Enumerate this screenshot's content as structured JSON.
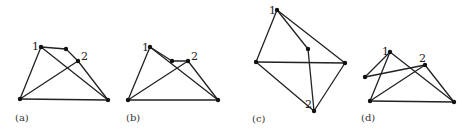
{
  "figure": {
    "panels": [
      {
        "id": "a",
        "caption": "(a)",
        "caption_pos": [
          15,
          121
        ],
        "nodes": [
          {
            "id": "1",
            "x": 41,
            "y": 47,
            "label": "1",
            "lx": 32,
            "ly": 50
          },
          {
            "id": "m",
            "x": 66,
            "y": 49,
            "label": ""
          },
          {
            "id": "2",
            "x": 78,
            "y": 61,
            "label": "2",
            "lx": 81,
            "ly": 60
          },
          {
            "id": "bl",
            "x": 20,
            "y": 99,
            "label": ""
          },
          {
            "id": "br",
            "x": 108,
            "y": 100,
            "label": ""
          }
        ],
        "edges": [
          [
            "1",
            "m"
          ],
          [
            "m",
            "2"
          ],
          [
            "2",
            "br"
          ],
          [
            "1",
            "bl"
          ],
          [
            "1",
            "br"
          ],
          [
            "bl",
            "2"
          ],
          [
            "bl",
            "br"
          ]
        ]
      },
      {
        "id": "b",
        "caption": "(b)",
        "caption_pos": [
          126,
          121
        ],
        "nodes": [
          {
            "id": "1",
            "x": 150,
            "y": 47,
            "label": "1",
            "lx": 142,
            "ly": 51
          },
          {
            "id": "m",
            "x": 172,
            "y": 61,
            "label": ""
          },
          {
            "id": "2",
            "x": 188,
            "y": 61,
            "label": "2",
            "lx": 191,
            "ly": 60
          },
          {
            "id": "bl",
            "x": 128,
            "y": 100,
            "label": ""
          },
          {
            "id": "br",
            "x": 218,
            "y": 100,
            "label": ""
          }
        ],
        "edges": [
          [
            "1",
            "m"
          ],
          [
            "m",
            "2"
          ],
          [
            "2",
            "br"
          ],
          [
            "1",
            "bl"
          ],
          [
            "1",
            "br"
          ],
          [
            "bl",
            "2"
          ],
          [
            "bl",
            "br"
          ]
        ]
      },
      {
        "id": "c",
        "caption": "(c)",
        "caption_pos": [
          252,
          122
        ],
        "nodes": [
          {
            "id": "1",
            "x": 277,
            "y": 10,
            "label": "1",
            "lx": 269,
            "ly": 14
          },
          {
            "id": "m",
            "x": 308,
            "y": 49,
            "label": ""
          },
          {
            "id": "l",
            "x": 256,
            "y": 62,
            "label": ""
          },
          {
            "id": "r",
            "x": 345,
            "y": 63,
            "label": ""
          },
          {
            "id": "2",
            "x": 314,
            "y": 111,
            "label": "2",
            "lx": 305,
            "ly": 108
          }
        ],
        "edges": [
          [
            "1",
            "l"
          ],
          [
            "1",
            "r"
          ],
          [
            "1",
            "m"
          ],
          [
            "m",
            "2"
          ],
          [
            "l",
            "r"
          ],
          [
            "l",
            "2"
          ],
          [
            "r",
            "2"
          ]
        ]
      },
      {
        "id": "d",
        "caption": "(d)",
        "caption_pos": [
          361,
          121
        ],
        "nodes": [
          {
            "id": "1",
            "x": 390,
            "y": 52,
            "label": "1",
            "lx": 382,
            "ly": 55
          },
          {
            "id": "2",
            "x": 425,
            "y": 65,
            "label": "2",
            "lx": 419,
            "ly": 62
          },
          {
            "id": "l",
            "x": 365,
            "y": 77,
            "label": ""
          },
          {
            "id": "bl",
            "x": 370,
            "y": 101,
            "label": ""
          },
          {
            "id": "br",
            "x": 454,
            "y": 102,
            "label": ""
          }
        ],
        "edges": [
          [
            "1",
            "l"
          ],
          [
            "l",
            "2"
          ],
          [
            "1",
            "bl"
          ],
          [
            "1",
            "br"
          ],
          [
            "2",
            "br"
          ],
          [
            "bl",
            "2"
          ],
          [
            "bl",
            "br"
          ]
        ]
      }
    ]
  }
}
